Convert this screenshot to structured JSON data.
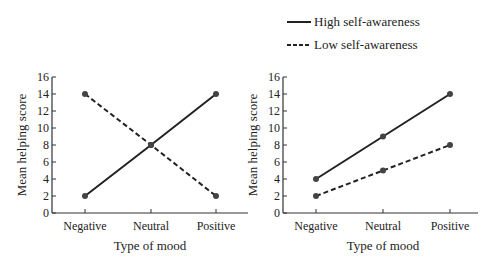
{
  "legend": {
    "items": [
      {
        "label": "High self-awareness",
        "style": "solid"
      },
      {
        "label": "Low self-awareness",
        "style": "dashed"
      }
    ]
  },
  "chart_data": [
    {
      "type": "line",
      "title": "",
      "categories": [
        "Negative",
        "Neutral",
        "Positive"
      ],
      "series": [
        {
          "name": "High self-awareness",
          "style": "solid",
          "values": [
            2,
            8,
            14
          ]
        },
        {
          "name": "Low self-awareness",
          "style": "dashed",
          "values": [
            14,
            8,
            2
          ]
        }
      ],
      "xlabel": "Type of mood",
      "ylabel": "Mean helping score",
      "ylim": [
        0,
        16
      ],
      "yticks": [
        0,
        2,
        4,
        6,
        8,
        10,
        12,
        14,
        16
      ],
      "grid": false
    },
    {
      "type": "line",
      "title": "",
      "categories": [
        "Negative",
        "Neutral",
        "Positive"
      ],
      "series": [
        {
          "name": "High self-awareness",
          "style": "solid",
          "values": [
            4,
            9,
            14
          ]
        },
        {
          "name": "Low self-awareness",
          "style": "dashed",
          "values": [
            2,
            5,
            8
          ]
        }
      ],
      "xlabel": "Type of mood",
      "ylabel": "Mean helping score",
      "ylim": [
        0,
        16
      ],
      "yticks": [
        0,
        2,
        4,
        6,
        8,
        10,
        12,
        14,
        16
      ],
      "grid": false
    }
  ],
  "colors": {
    "line": "#222222",
    "marker": "#444444"
  }
}
